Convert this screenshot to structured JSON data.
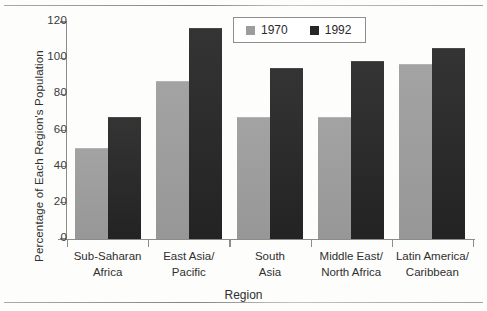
{
  "chart_data": {
    "type": "bar",
    "title": "",
    "xlabel": "Region",
    "ylabel": "Percentage of Each Region's Population",
    "ylim": [
      0,
      120
    ],
    "yticks": [
      "0",
      "20",
      "40",
      "60",
      "80",
      "100",
      "120"
    ],
    "grid": false,
    "legend_position": "top-center",
    "categories": [
      "Sub-Saharan Africa",
      "East Asia/Pacific",
      "South Asia",
      "Middle East/North Africa",
      "Latin America/Caribbean"
    ],
    "category_lines": [
      [
        "Sub-Saharan",
        "Africa"
      ],
      [
        "East Asia/",
        "Pacific"
      ],
      [
        "South",
        "Asia"
      ],
      [
        "Middle East/",
        "North Africa"
      ],
      [
        "Latin America/",
        "Caribbean"
      ]
    ],
    "series": [
      {
        "name": "1970",
        "color": "#9c9c9c",
        "values": [
          50,
          87,
          67,
          67,
          96
        ]
      },
      {
        "name": "1992",
        "color": "#262626",
        "values": [
          67,
          116,
          94,
          98,
          105
        ]
      }
    ]
  },
  "legend": {
    "items": [
      {
        "label": "1970"
      },
      {
        "label": "1992"
      }
    ]
  },
  "axes": {
    "y_title": "Percentage of Each Region's Population",
    "x_title": "Region"
  }
}
